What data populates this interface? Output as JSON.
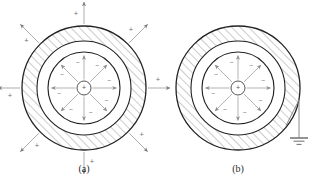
{
  "figure": {
    "title": "",
    "background": "#ffffff",
    "stroke_dark": "#222222",
    "stroke_light": "#9a9a9a",
    "hatch_color": "#8d8d8d",
    "text_color": "#2b2b2b"
  },
  "panels": [
    {
      "id": "panel-a",
      "caption": "(a)",
      "caption_x": 84,
      "caption_y": 172,
      "center": {
        "x": 84,
        "y": 88
      },
      "radii": {
        "outer_shell": 62,
        "inner_shell": 47,
        "inner_sphere": 36,
        "core": 7
      },
      "core_charge_label": "+",
      "inner_surface_charge_label": "−",
      "outer_field_charge_label": "+",
      "has_external_field": true,
      "has_ground": false,
      "internal_arrows": [
        {
          "angle_deg": 90,
          "charge": "−"
        },
        {
          "angle_deg": 45,
          "charge": "−"
        },
        {
          "angle_deg": 0,
          "charge": "−"
        },
        {
          "angle_deg": -45,
          "charge": "−"
        },
        {
          "angle_deg": -90,
          "charge": "−"
        },
        {
          "angle_deg": -135,
          "charge": "−"
        },
        {
          "angle_deg": 180,
          "charge": "−"
        },
        {
          "angle_deg": 135,
          "charge": "−"
        }
      ],
      "external_arrows": [
        {
          "angle_deg": 90,
          "charge": "+"
        },
        {
          "angle_deg": 45,
          "charge": "+"
        },
        {
          "angle_deg": 0,
          "charge": "+"
        },
        {
          "angle_deg": -45,
          "charge": "+"
        },
        {
          "angle_deg": -90,
          "charge": "+"
        },
        {
          "angle_deg": -135,
          "charge": "+"
        },
        {
          "angle_deg": 180,
          "charge": "+"
        },
        {
          "angle_deg": 135,
          "charge": "+"
        }
      ]
    },
    {
      "id": "panel-b",
      "caption": "(b)",
      "caption_x": 238,
      "caption_y": 172,
      "center": {
        "x": 238,
        "y": 88
      },
      "radii": {
        "outer_shell": 62,
        "inner_shell": 47,
        "inner_sphere": 36,
        "core": 7
      },
      "core_charge_label": "+",
      "inner_surface_charge_label": "−",
      "outer_field_charge_label": "+",
      "has_external_field": false,
      "has_ground": true,
      "internal_arrows": [
        {
          "angle_deg": 90,
          "charge": "−"
        },
        {
          "angle_deg": 45,
          "charge": "−"
        },
        {
          "angle_deg": 0,
          "charge": "−"
        },
        {
          "angle_deg": -45,
          "charge": "−"
        },
        {
          "angle_deg": -90,
          "charge": "−"
        },
        {
          "angle_deg": -135,
          "charge": "−"
        },
        {
          "angle_deg": 180,
          "charge": "−"
        },
        {
          "angle_deg": 135,
          "charge": "−"
        }
      ],
      "external_arrows": [],
      "ground": {
        "label": "ground-symbol",
        "attach_angle_deg": -38,
        "drop_x": 299,
        "drop_y_top": 100,
        "drop_y_bottom": 138,
        "bars": [
          18,
          11,
          5
        ]
      }
    }
  ]
}
